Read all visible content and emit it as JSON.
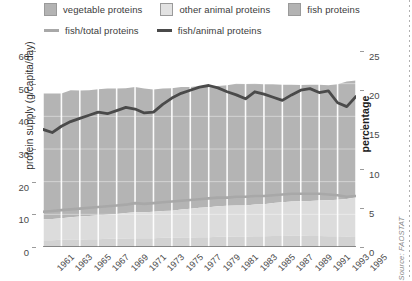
{
  "legend": {
    "areas": [
      {
        "label": "vegetable proteins",
        "color": "#b3b3b3",
        "name": "legend-vegetable-proteins"
      },
      {
        "label": "other animal proteins",
        "color": "#dcdcdc",
        "name": "legend-other-animal-proteins"
      },
      {
        "label": "fish proteins",
        "color": "#b3b3b3",
        "name": "legend-fish-proteins"
      }
    ],
    "lines": [
      {
        "label": "fish/total proteins",
        "color": "#a8a8a8",
        "name": "legend-fish-total-proteins"
      },
      {
        "label": "fish/animal proteins",
        "color": "#4a4a4a",
        "name": "legend-fish-animal-proteins"
      }
    ]
  },
  "axes": {
    "left_title": "protein supply (g/capita/day)",
    "right_title": "percentage",
    "left_ticks": [
      "60",
      "50",
      "40",
      "30",
      "20",
      "10",
      "0"
    ],
    "right_ticks": [
      "25",
      "20",
      "15",
      "10",
      "5",
      "0"
    ],
    "x_ticks": [
      "1961",
      "1963",
      "1965",
      "1967",
      "1969",
      "1971",
      "1973",
      "1975",
      "1977",
      "1979",
      "1981",
      "1983",
      "1985",
      "1987",
      "1989",
      "1991",
      "1993",
      "1995"
    ]
  },
  "source": "Source: FAOSTAT",
  "chart_data": {
    "type": "area",
    "title": "",
    "subtitle": "",
    "xlabel": "",
    "ylabel": "protein supply (g/capita/day)",
    "y2label": "percentage",
    "ylim": [
      0,
      60
    ],
    "y2lim": [
      0,
      25
    ],
    "xlim": [
      1961,
      1995
    ],
    "grid": "vertical white gridlines every 2 years",
    "legend_position": "top",
    "stacked": true,
    "x": [
      1961,
      1962,
      1963,
      1964,
      1965,
      1966,
      1967,
      1968,
      1969,
      1970,
      1971,
      1972,
      1973,
      1974,
      1975,
      1976,
      1977,
      1978,
      1979,
      1980,
      1981,
      1982,
      1983,
      1984,
      1985,
      1986,
      1987,
      1988,
      1989,
      1990,
      1991,
      1992,
      1993,
      1994,
      1995
    ],
    "series": [
      {
        "name": "fish proteins",
        "units": "g/capita/day",
        "axis": "left",
        "color": "#d9d9d9",
        "stack_order": 1,
        "values": [
          2.1,
          2.1,
          2.2,
          2.3,
          2.3,
          2.4,
          2.4,
          2.5,
          2.5,
          2.6,
          2.7,
          2.7,
          2.7,
          2.8,
          2.8,
          2.9,
          2.9,
          3.0,
          3.0,
          3.1,
          3.1,
          3.2,
          3.2,
          3.3,
          3.3,
          3.4,
          3.4,
          3.5,
          3.5,
          3.4,
          3.4,
          3.3,
          3.3,
          3.2,
          3.3
        ]
      },
      {
        "name": "other animal proteins",
        "units": "g/capita/day",
        "axis": "left",
        "color": "#d9d9d9",
        "stack_order": 2,
        "values": [
          6.4,
          6.5,
          6.6,
          6.8,
          7.0,
          7.1,
          7.3,
          7.4,
          7.6,
          7.8,
          7.9,
          7.9,
          8.1,
          8.2,
          8.3,
          8.6,
          8.8,
          9.0,
          9.2,
          9.4,
          9.5,
          9.5,
          9.5,
          9.7,
          9.8,
          10.1,
          10.3,
          10.4,
          10.5,
          10.7,
          10.8,
          11.0,
          11.2,
          11.5,
          11.9
        ]
      },
      {
        "name": "vegetable proteins",
        "units": "g/capita/day",
        "axis": "left",
        "color": "#b3b3b3",
        "stack_order": 3,
        "values": [
          38.5,
          38.4,
          38.2,
          38.9,
          38.6,
          38.5,
          38.6,
          38.6,
          38.4,
          38.2,
          38.4,
          37.9,
          37.4,
          37.5,
          37.5,
          37.5,
          37.3,
          37.3,
          37.1,
          36.8,
          36.9,
          37.3,
          37.2,
          37.0,
          36.7,
          36.3,
          36.0,
          35.8,
          35.6,
          35.6,
          35.5,
          35.2,
          35.3,
          36.0,
          35.8
        ]
      },
      {
        "name": "total protein supply",
        "units": "g/capita/day",
        "axis": "left",
        "derived": true,
        "values": [
          47.0,
          47.0,
          47.0,
          48.0,
          47.9,
          48.0,
          48.3,
          48.5,
          48.5,
          48.6,
          49.0,
          48.5,
          48.2,
          48.5,
          48.6,
          49.0,
          49.0,
          49.3,
          49.3,
          49.3,
          49.5,
          50.0,
          49.9,
          50.0,
          49.8,
          49.8,
          49.7,
          49.7,
          49.6,
          49.7,
          49.7,
          49.5,
          49.8,
          50.7,
          51.0
        ]
      },
      {
        "name": "fish/total proteins",
        "units": "percentage",
        "axis": "right",
        "color": "#a8a8a8",
        "type": "line",
        "values": [
          4.5,
          4.6,
          4.7,
          4.8,
          4.9,
          5.0,
          5.1,
          5.2,
          5.3,
          5.4,
          5.6,
          5.5,
          5.6,
          5.7,
          5.8,
          5.9,
          6.0,
          6.1,
          6.2,
          6.3,
          6.3,
          6.4,
          6.4,
          6.5,
          6.5,
          6.6,
          6.7,
          6.8,
          6.8,
          6.8,
          6.8,
          6.7,
          6.6,
          6.4,
          6.5
        ]
      },
      {
        "name": "fish/animal proteins",
        "units": "percentage",
        "axis": "right",
        "color": "#4a4a4a",
        "type": "line",
        "values": [
          15.0,
          14.6,
          15.4,
          16.0,
          16.4,
          16.8,
          17.2,
          17.0,
          17.4,
          17.8,
          17.6,
          17.1,
          17.2,
          18.2,
          19.0,
          19.6,
          20.0,
          20.4,
          20.6,
          20.3,
          19.8,
          19.4,
          18.9,
          19.8,
          19.5,
          19.1,
          18.7,
          19.4,
          20.0,
          20.2,
          19.7,
          19.9,
          18.4,
          17.9,
          19.2
        ]
      }
    ]
  }
}
